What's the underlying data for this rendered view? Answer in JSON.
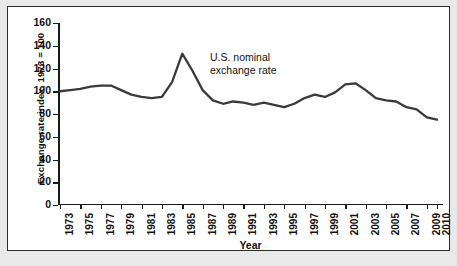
{
  "chart_data": {
    "type": "line",
    "title": "",
    "xlabel": "Year",
    "ylabel": "Exchange rate index, 1973 = 100",
    "annotation": {
      "line1": "U.S. nominal",
      "line2": "exchange rate"
    },
    "series_name": "U.S. nominal exchange rate",
    "line_color": "#3a3a3a",
    "grid": false,
    "legend_position": "inline-annotation",
    "ylim": [
      0,
      160
    ],
    "yticks": [
      0,
      20,
      40,
      60,
      80,
      100,
      120,
      140,
      160
    ],
    "xlim": [
      1973,
      2010
    ],
    "xticks": [
      1973,
      1975,
      1977,
      1979,
      1981,
      1983,
      1985,
      1987,
      1989,
      1991,
      1993,
      1995,
      1997,
      1999,
      2001,
      2003,
      2005,
      2007,
      2009,
      2010
    ],
    "x": [
      1973,
      1974,
      1975,
      1976,
      1977,
      1978,
      1979,
      1980,
      1981,
      1982,
      1983,
      1984,
      1985,
      1986,
      1987,
      1988,
      1989,
      1990,
      1991,
      1992,
      1993,
      1994,
      1995,
      1996,
      1997,
      1998,
      1999,
      2000,
      2001,
      2002,
      2003,
      2004,
      2005,
      2006,
      2007,
      2008,
      2009,
      2010
    ],
    "values": [
      100,
      101,
      102,
      104,
      105,
      105,
      101,
      97,
      95,
      94,
      95,
      108,
      133,
      118,
      101,
      92,
      89,
      91,
      90,
      88,
      90,
      88,
      86,
      89,
      94,
      97,
      95,
      99,
      106,
      107,
      101,
      94,
      92,
      91,
      86,
      84,
      77,
      75
    ]
  }
}
